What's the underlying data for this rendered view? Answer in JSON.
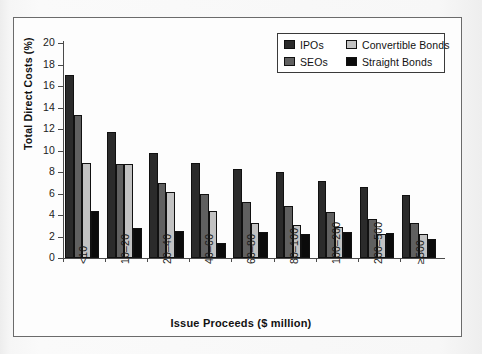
{
  "chart_data": {
    "type": "bar",
    "title": "",
    "xlabel": "Issue Proceeds ($ million)",
    "ylabel": "Total Direct Costs (%)",
    "ylim": [
      0,
      20
    ],
    "yticks": [
      0,
      2,
      4,
      6,
      8,
      10,
      12,
      14,
      16,
      18,
      20
    ],
    "grid": false,
    "legend_position": "top-right",
    "categories": [
      "<10",
      "10–20",
      "20–40",
      "40–60",
      "60–80",
      "80–100",
      "100–200",
      "200–500",
      "≥500"
    ],
    "series": [
      {
        "name": "IPOs",
        "color": "#2b2b2b",
        "values": [
          17.0,
          11.7,
          9.8,
          8.8,
          8.3,
          8.0,
          7.15,
          6.65,
          5.85
        ]
      },
      {
        "name": "SEOs",
        "color": "#606060",
        "values": [
          13.3,
          8.7,
          7.0,
          5.95,
          5.25,
          4.8,
          4.3,
          3.6,
          3.3
        ]
      },
      {
        "name": "Convertible Bonds",
        "color": "#c2c2c2",
        "values": [
          8.8,
          8.7,
          6.15,
          4.35,
          3.3,
          3.1,
          2.85,
          2.25,
          2.2
        ]
      },
      {
        "name": "Straight Bonds",
        "color": "#0b0b0b",
        "values": [
          4.4,
          2.8,
          2.5,
          1.4,
          2.45,
          2.25,
          2.4,
          2.3,
          1.8
        ]
      }
    ]
  },
  "figure": {
    "frame_border_color": "#6b6b6b",
    "plot_background": "#fdfdfd",
    "axis_color": "#4a4a4a"
  }
}
